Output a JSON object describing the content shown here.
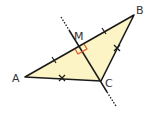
{
  "diagram": {
    "labels": {
      "A": "A",
      "B": "B",
      "C": "C",
      "M": "M"
    },
    "points": {
      "A": [
        25,
        77
      ],
      "B": [
        134,
        15
      ],
      "C": [
        101,
        81
      ],
      "M": [
        79,
        46
      ]
    },
    "colors": {
      "triangle_fill": "#fcf4c4",
      "stroke": "#1a1a1a",
      "right_angle": "#e0522a",
      "label": "#333333"
    },
    "marks": {
      "AM_MB": "single tick (equal segments)",
      "AC_BC": "cross (equal segments)",
      "M": "right angle"
    }
  }
}
